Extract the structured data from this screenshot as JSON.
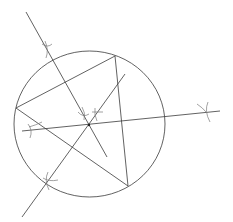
{
  "diagram": {
    "elements": {
      "circle": "circumcircle",
      "triangle": "inscribed-triangle",
      "bisectors": [
        "perpendicular-bisector-1",
        "perpendicular-bisector-2",
        "perpendicular-bisector-3"
      ],
      "center": "circumcenter"
    },
    "stroke_color": "#3a3a3a",
    "arc_color": "#7a7a7a",
    "background": "#ffffff"
  }
}
